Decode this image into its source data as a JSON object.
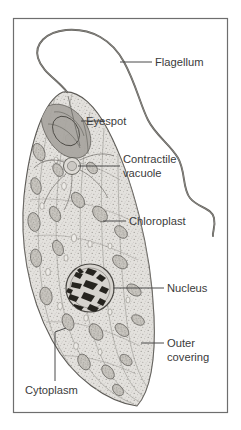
{
  "figure": {
    "frame": {
      "stroke_color": "#6e6e6e",
      "background": "#ffffff"
    },
    "ink_color": "#3b3b3b"
  },
  "labels": [
    {
      "id": "flagellum",
      "text": "Flagellum",
      "lines": [
        "Flagellum"
      ]
    },
    {
      "id": "eyespot",
      "text": "Eyespot",
      "lines": [
        "Eyespot"
      ]
    },
    {
      "id": "contractile-vacuole",
      "text": "Contractile vacuole",
      "lines": [
        "Contractile",
        "vacuole"
      ]
    },
    {
      "id": "chloroplast",
      "text": "Chloroplast",
      "lines": [
        "Chloroplast"
      ]
    },
    {
      "id": "nucleus",
      "text": "Nucleus",
      "lines": [
        "Nucleus"
      ]
    },
    {
      "id": "outer-covering",
      "text": "Outer covering",
      "lines": [
        "Outer",
        "covering"
      ]
    },
    {
      "id": "cytoplasm",
      "text": "Cytoplasm",
      "lines": [
        "Cytoplasm"
      ]
    }
  ],
  "label_text": {
    "flagellum": "Flagellum",
    "eyespot": "Eyespot",
    "contractile_line1": "Contractile",
    "contractile_line2": "vacuole",
    "chloroplast": "Chloroplast",
    "nucleus": "Nucleus",
    "outer_line1": "Outer",
    "outer_line2": "covering",
    "cytoplasm": "Cytoplasm"
  }
}
